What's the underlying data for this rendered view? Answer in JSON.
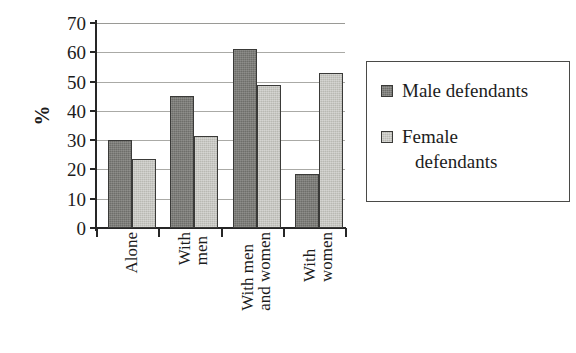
{
  "chart_data": {
    "type": "bar",
    "title": "",
    "subtitle": "",
    "xlabel": "",
    "ylabel": "%",
    "ylim": [
      0,
      70
    ],
    "yticks": [
      0,
      10,
      20,
      30,
      40,
      50,
      60,
      70
    ],
    "ytick_labels": [
      "0",
      "10",
      "20",
      "30",
      "40",
      "50",
      "60",
      "70"
    ],
    "grid": true,
    "grid_axis": "y",
    "legend_position": "right",
    "categories": [
      "Alone",
      "With men",
      "With men and women",
      "With women"
    ],
    "category_label_lines": [
      [
        "Alone"
      ],
      [
        "With",
        "men"
      ],
      [
        "With men",
        "and women"
      ],
      [
        "With",
        "women"
      ]
    ],
    "category_label_rotation": -90,
    "series": [
      {
        "name": "Male defendants",
        "name_lines": [
          "Male defendants"
        ],
        "color": "#6e6e6a",
        "values": [
          30,
          45,
          61,
          18.5
        ]
      },
      {
        "name": "Female defendants",
        "name_lines": [
          "Female",
          "defendants"
        ],
        "color": "#b9b9b3",
        "values": [
          23.5,
          31.5,
          49,
          53
        ]
      }
    ]
  },
  "axis": {
    "y_title": "%"
  }
}
